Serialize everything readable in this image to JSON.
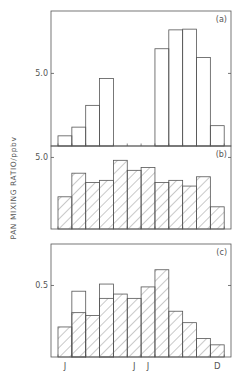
{
  "chart_data": [
    {
      "type": "bar",
      "panel_label": "(a)",
      "categories": [
        "J",
        "F",
        "M",
        "A",
        "M",
        "J",
        "J",
        "A",
        "S",
        "O",
        "N",
        "D"
      ],
      "values": [
        0.7,
        1.3,
        2.8,
        4.65,
        null,
        null,
        null,
        6.7,
        8.0,
        8.05,
        6.1,
        1.4
      ],
      "fill": "none",
      "ylim": [
        0,
        9.3
      ],
      "yticks": [
        {
          "value": 5.0,
          "label": "5.0"
        }
      ],
      "grid": false
    },
    {
      "type": "bar",
      "panel_label": "(b)",
      "categories": [
        "J",
        "F",
        "M",
        "A",
        "M",
        "J",
        "J",
        "A",
        "S",
        "O",
        "N",
        "D"
      ],
      "values": [
        2.25,
        3.9,
        3.25,
        3.4,
        4.8,
        4.1,
        4.3,
        3.25,
        3.4,
        3.0,
        3.65,
        1.55
      ],
      "fill": "hatched",
      "ylim": [
        0,
        5.8
      ],
      "yticks": [
        {
          "value": 5.0,
          "label": "5.0"
        }
      ],
      "grid": false
    },
    {
      "type": "bar",
      "panel_label": "(c)",
      "categories": [
        "J",
        "F",
        "M",
        "A",
        "M",
        "J",
        "J",
        "A",
        "S",
        "O",
        "N",
        "D"
      ],
      "series": [
        {
          "name": "hatched",
          "values": [
            0.21,
            0.31,
            0.29,
            0.41,
            0.44,
            0.41,
            0.49,
            0.61,
            0.32,
            0.24,
            0.13,
            0.085
          ]
        },
        {
          "name": "open_extension",
          "values": [
            null,
            0.46,
            null,
            0.51,
            null,
            null,
            null,
            null,
            null,
            null,
            null,
            null
          ]
        }
      ],
      "ylim": [
        0,
        0.79
      ],
      "yticks": [
        {
          "value": 0.5,
          "label": "0.5"
        }
      ],
      "grid": false
    }
  ],
  "xaxis": {
    "tick_labels": [
      {
        "label": "J",
        "bar_index": 0
      },
      {
        "label": "J",
        "bar_index": 5
      },
      {
        "label": "J",
        "bar_index": 6
      },
      {
        "label": "D",
        "bar_index": 11
      }
    ]
  },
  "ylabel": "PAN MIXING RATIO/ppbv",
  "colors": {
    "line": "#555555",
    "hatch": "#777777",
    "background": "#ffffff"
  }
}
